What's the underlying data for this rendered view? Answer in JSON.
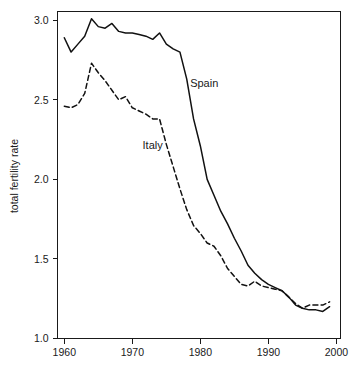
{
  "chart_data": {
    "type": "line",
    "title": "",
    "xlabel": "",
    "ylabel": "total fertility rate",
    "xlim": [
      1959,
      2000.5
    ],
    "ylim": [
      1.0,
      3.05
    ],
    "grid": false,
    "legend_position": "inline-annotation",
    "x_ticks": [
      "1960",
      "1970",
      "1980",
      "1990",
      "2000"
    ],
    "x_tick_values": [
      1960,
      1970,
      1980,
      1990,
      2000
    ],
    "y_ticks": [
      "1.0",
      "1.5",
      "2.0",
      "2.5",
      "3.0"
    ],
    "y_tick_values": [
      1.0,
      1.5,
      2.0,
      2.5,
      3.0
    ],
    "x": [
      1960,
      1961,
      1962,
      1963,
      1964,
      1965,
      1966,
      1967,
      1968,
      1969,
      1970,
      1971,
      1972,
      1973,
      1974,
      1975,
      1976,
      1977,
      1978,
      1979,
      1980,
      1981,
      1982,
      1983,
      1984,
      1985,
      1986,
      1987,
      1988,
      1989,
      1990,
      1991,
      1992,
      1993,
      1994,
      1995,
      1996,
      1997,
      1998,
      1999
    ],
    "series": [
      {
        "name": "Spain",
        "style": "solid",
        "color": "#111111",
        "values": [
          2.89,
          2.8,
          2.85,
          2.9,
          3.01,
          2.96,
          2.95,
          2.98,
          2.93,
          2.92,
          2.92,
          2.91,
          2.9,
          2.88,
          2.92,
          2.85,
          2.82,
          2.8,
          2.63,
          2.38,
          2.21,
          2.0,
          1.9,
          1.8,
          1.72,
          1.63,
          1.55,
          1.46,
          1.41,
          1.37,
          1.34,
          1.32,
          1.3,
          1.26,
          1.21,
          1.19,
          1.18,
          1.18,
          1.17,
          1.2
        ]
      },
      {
        "name": "Italy",
        "style": "dashed",
        "color": "#111111",
        "values": [
          2.46,
          2.45,
          2.47,
          2.54,
          2.73,
          2.67,
          2.62,
          2.56,
          2.5,
          2.52,
          2.45,
          2.43,
          2.41,
          2.38,
          2.38,
          2.22,
          2.08,
          1.94,
          1.81,
          1.71,
          1.66,
          1.6,
          1.58,
          1.52,
          1.44,
          1.39,
          1.34,
          1.33,
          1.36,
          1.33,
          1.32,
          1.31,
          1.3,
          1.26,
          1.22,
          1.19,
          1.21,
          1.21,
          1.21,
          1.23
        ]
      }
    ],
    "annotations": [
      {
        "text": "Spain",
        "x": 1978.5,
        "y": 2.58
      },
      {
        "text": "Italy",
        "x": 1971.5,
        "y": 2.19
      }
    ]
  }
}
